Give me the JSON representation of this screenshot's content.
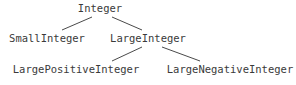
{
  "diagram": {
    "type": "class-hierarchy-tree",
    "background_color": "#ffffff",
    "text_color": "#3a3a3a",
    "edge_color": "#4a4a4a",
    "nodes": [
      {
        "id": "integer",
        "label": "Integer",
        "level": 0,
        "cx": 100,
        "cy": 8
      },
      {
        "id": "small-integer",
        "label": "SmallInteger",
        "level": 1,
        "cx": 47,
        "cy": 38
      },
      {
        "id": "large-integer",
        "label": "LargeInteger",
        "level": 1,
        "cx": 148,
        "cy": 38
      },
      {
        "id": "large-positive-integer",
        "label": "LargePositiveInteger",
        "level": 2,
        "cx": 76,
        "cy": 69
      },
      {
        "id": "large-negative-integer",
        "label": "LargeNegativeInteger",
        "level": 2,
        "cx": 230,
        "cy": 69
      }
    ],
    "edges": [
      {
        "id": "edge-integer-smallinteger",
        "from": "integer",
        "to": "small-integer",
        "x1": 92,
        "y1": 17,
        "x2": 62,
        "y2": 30
      },
      {
        "id": "edge-integer-largeinteger",
        "from": "integer",
        "to": "large-integer",
        "x1": 112,
        "y1": 17,
        "x2": 142,
        "y2": 30
      },
      {
        "id": "edge-largeinteger-largepositive",
        "from": "large-integer",
        "to": "large-positive-integer",
        "x1": 142,
        "y1": 47,
        "x2": 112,
        "y2": 61
      },
      {
        "id": "edge-largeinteger-largenegative",
        "from": "large-integer",
        "to": "large-negative-integer",
        "x1": 162,
        "y1": 47,
        "x2": 200,
        "y2": 61
      }
    ]
  }
}
